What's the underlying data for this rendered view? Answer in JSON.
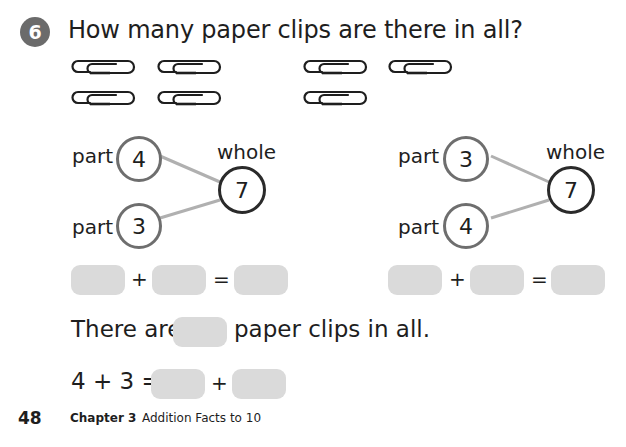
{
  "problem": {
    "number": "6",
    "question": "How many paper clips are there in all?"
  },
  "paper_clips": {
    "left_group_count": 4,
    "right_group_count": 3,
    "total": 7
  },
  "number_bonds": [
    {
      "part_label_top": "part",
      "part_top": "4",
      "part_label_bottom": "part",
      "part_bottom": "3",
      "whole_label": "whole",
      "whole": "7"
    },
    {
      "part_label_top": "part",
      "part_top": "3",
      "part_label_bottom": "part",
      "part_bottom": "4",
      "whole_label": "whole",
      "whole": "7"
    }
  ],
  "equations": {
    "plus": "+",
    "equals": "=",
    "left": {
      "blank1": "",
      "blank2": "",
      "result": ""
    },
    "right": {
      "blank1": "",
      "blank2": "",
      "result": ""
    }
  },
  "sentence": {
    "prefix": "There are",
    "suffix": "paper clips in all.",
    "blank": ""
  },
  "bottom_equation": {
    "lhs": "4 + 3 =",
    "plus": "+",
    "blank1": "",
    "blank2": ""
  },
  "footer": {
    "page_number": "48",
    "chapter": "Chapter 3",
    "chapter_title": "Addition Facts to 10"
  },
  "colors": {
    "badge": "#6b6b6b",
    "part_circle": "#6e6e6e",
    "whole_circle": "#2a2a2a",
    "connector": "#b0b0b0",
    "blank_box": "#dadada"
  }
}
